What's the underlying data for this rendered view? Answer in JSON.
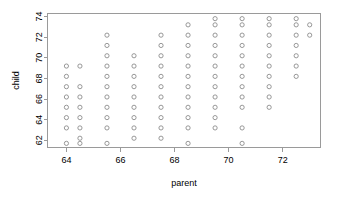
{
  "chart_data": {
    "type": "scatter",
    "title": "",
    "xlabel": "parent",
    "ylabel": "child",
    "xlim": [
      63.3,
      73.4
    ],
    "ylim": [
      61.3,
      74.3
    ],
    "xticks": [
      64,
      66,
      68,
      70,
      72
    ],
    "xtick_labels": [
      "64",
      "66",
      "68",
      "70",
      "72"
    ],
    "yticks": [
      62,
      64,
      66,
      68,
      70,
      72,
      74
    ],
    "ytick_labels": [
      "62",
      "64",
      "66",
      "68",
      "70",
      "72",
      "74"
    ],
    "grid": false,
    "legend": null,
    "marker": "open-circle",
    "marker_color": "#8c8c8c",
    "points": [
      {
        "x": 64.0,
        "y": 61.7
      },
      {
        "x": 64.0,
        "y": 63.2
      },
      {
        "x": 64.0,
        "y": 64.2
      },
      {
        "x": 64.0,
        "y": 65.2
      },
      {
        "x": 64.0,
        "y": 66.2
      },
      {
        "x": 64.0,
        "y": 67.2
      },
      {
        "x": 64.0,
        "y": 68.2
      },
      {
        "x": 64.0,
        "y": 69.2
      },
      {
        "x": 64.5,
        "y": 61.7
      },
      {
        "x": 64.5,
        "y": 62.2
      },
      {
        "x": 64.5,
        "y": 63.2
      },
      {
        "x": 64.5,
        "y": 64.2
      },
      {
        "x": 64.5,
        "y": 65.2
      },
      {
        "x": 64.5,
        "y": 66.2
      },
      {
        "x": 64.5,
        "y": 67.2
      },
      {
        "x": 64.5,
        "y": 69.2
      },
      {
        "x": 65.5,
        "y": 61.7
      },
      {
        "x": 65.5,
        "y": 63.2
      },
      {
        "x": 65.5,
        "y": 64.2
      },
      {
        "x": 65.5,
        "y": 65.2
      },
      {
        "x": 65.5,
        "y": 66.2
      },
      {
        "x": 65.5,
        "y": 67.2
      },
      {
        "x": 65.5,
        "y": 68.2
      },
      {
        "x": 65.5,
        "y": 69.2
      },
      {
        "x": 65.5,
        "y": 70.2
      },
      {
        "x": 65.5,
        "y": 71.2
      },
      {
        "x": 65.5,
        "y": 72.2
      },
      {
        "x": 66.5,
        "y": 62.2
      },
      {
        "x": 66.5,
        "y": 63.2
      },
      {
        "x": 66.5,
        "y": 64.2
      },
      {
        "x": 66.5,
        "y": 65.2
      },
      {
        "x": 66.5,
        "y": 66.2
      },
      {
        "x": 66.5,
        "y": 67.2
      },
      {
        "x": 66.5,
        "y": 68.2
      },
      {
        "x": 66.5,
        "y": 69.2
      },
      {
        "x": 66.5,
        "y": 70.2
      },
      {
        "x": 67.5,
        "y": 62.2
      },
      {
        "x": 67.5,
        "y": 63.2
      },
      {
        "x": 67.5,
        "y": 64.2
      },
      {
        "x": 67.5,
        "y": 65.2
      },
      {
        "x": 67.5,
        "y": 66.2
      },
      {
        "x": 67.5,
        "y": 67.2
      },
      {
        "x": 67.5,
        "y": 68.2
      },
      {
        "x": 67.5,
        "y": 69.2
      },
      {
        "x": 67.5,
        "y": 70.2
      },
      {
        "x": 67.5,
        "y": 71.2
      },
      {
        "x": 67.5,
        "y": 72.2
      },
      {
        "x": 68.5,
        "y": 61.7
      },
      {
        "x": 68.5,
        "y": 63.2
      },
      {
        "x": 68.5,
        "y": 64.2
      },
      {
        "x": 68.5,
        "y": 65.2
      },
      {
        "x": 68.5,
        "y": 66.2
      },
      {
        "x": 68.5,
        "y": 67.2
      },
      {
        "x": 68.5,
        "y": 68.2
      },
      {
        "x": 68.5,
        "y": 69.2
      },
      {
        "x": 68.5,
        "y": 70.2
      },
      {
        "x": 68.5,
        "y": 71.2
      },
      {
        "x": 68.5,
        "y": 72.2
      },
      {
        "x": 68.5,
        "y": 73.2
      },
      {
        "x": 69.5,
        "y": 63.2
      },
      {
        "x": 69.5,
        "y": 64.2
      },
      {
        "x": 69.5,
        "y": 65.2
      },
      {
        "x": 69.5,
        "y": 66.2
      },
      {
        "x": 69.5,
        "y": 67.2
      },
      {
        "x": 69.5,
        "y": 68.2
      },
      {
        "x": 69.5,
        "y": 69.2
      },
      {
        "x": 69.5,
        "y": 70.2
      },
      {
        "x": 69.5,
        "y": 71.2
      },
      {
        "x": 69.5,
        "y": 72.2
      },
      {
        "x": 69.5,
        "y": 73.2
      },
      {
        "x": 69.5,
        "y": 73.8
      },
      {
        "x": 70.5,
        "y": 61.7
      },
      {
        "x": 70.5,
        "y": 63.2
      },
      {
        "x": 70.5,
        "y": 65.2
      },
      {
        "x": 70.5,
        "y": 66.2
      },
      {
        "x": 70.5,
        "y": 67.2
      },
      {
        "x": 70.5,
        "y": 68.2
      },
      {
        "x": 70.5,
        "y": 69.2
      },
      {
        "x": 70.5,
        "y": 70.2
      },
      {
        "x": 70.5,
        "y": 71.2
      },
      {
        "x": 70.5,
        "y": 72.2
      },
      {
        "x": 70.5,
        "y": 73.2
      },
      {
        "x": 70.5,
        "y": 73.8
      },
      {
        "x": 71.5,
        "y": 65.2
      },
      {
        "x": 71.5,
        "y": 66.2
      },
      {
        "x": 71.5,
        "y": 67.2
      },
      {
        "x": 71.5,
        "y": 68.2
      },
      {
        "x": 71.5,
        "y": 69.2
      },
      {
        "x": 71.5,
        "y": 70.2
      },
      {
        "x": 71.5,
        "y": 71.2
      },
      {
        "x": 71.5,
        "y": 72.2
      },
      {
        "x": 71.5,
        "y": 73.2
      },
      {
        "x": 71.5,
        "y": 73.8
      },
      {
        "x": 72.5,
        "y": 68.2
      },
      {
        "x": 72.5,
        "y": 69.2
      },
      {
        "x": 72.5,
        "y": 70.2
      },
      {
        "x": 72.5,
        "y": 71.2
      },
      {
        "x": 72.5,
        "y": 72.2
      },
      {
        "x": 72.5,
        "y": 73.2
      },
      {
        "x": 72.5,
        "y": 73.8
      },
      {
        "x": 73.0,
        "y": 72.2
      },
      {
        "x": 73.0,
        "y": 73.2
      }
    ]
  }
}
